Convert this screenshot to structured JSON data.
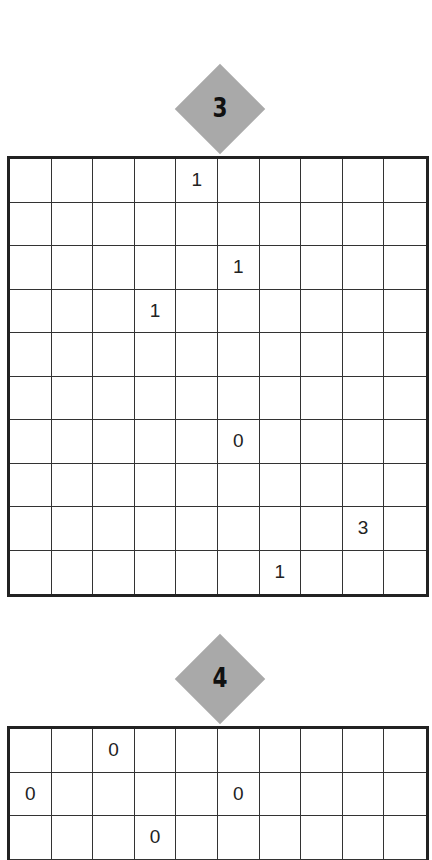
{
  "puzzles": [
    {
      "number": "3",
      "rows": 10,
      "cols": 10,
      "clues": [
        [
          "",
          "",
          "",
          "",
          "1",
          "",
          "",
          "",
          "",
          ""
        ],
        [
          "",
          "",
          "",
          "",
          "",
          "",
          "",
          "",
          "",
          ""
        ],
        [
          "",
          "",
          "",
          "",
          "",
          "1",
          "",
          "",
          "",
          ""
        ],
        [
          "",
          "",
          "",
          "1",
          "",
          "",
          "",
          "",
          "",
          ""
        ],
        [
          "",
          "",
          "",
          "",
          "",
          "",
          "",
          "",
          "",
          ""
        ],
        [
          "",
          "",
          "",
          "",
          "",
          "",
          "",
          "",
          "",
          ""
        ],
        [
          "",
          "",
          "",
          "",
          "",
          "0",
          "",
          "",
          "",
          ""
        ],
        [
          "",
          "",
          "",
          "",
          "",
          "",
          "",
          "",
          "",
          ""
        ],
        [
          "",
          "",
          "",
          "",
          "",
          "",
          "",
          "",
          "3",
          ""
        ],
        [
          "",
          "",
          "",
          "",
          "",
          "",
          "1",
          "",
          "",
          ""
        ]
      ]
    },
    {
      "number": "4",
      "rows": 3,
      "cols": 10,
      "clues": [
        [
          "",
          "",
          "0",
          "",
          "",
          "",
          "",
          "",
          "",
          ""
        ],
        [
          "0",
          "",
          "",
          "",
          "",
          "0",
          "",
          "",
          "",
          ""
        ],
        [
          "",
          "",
          "",
          "0",
          "",
          "",
          "",
          "",
          "",
          ""
        ]
      ]
    }
  ],
  "colors": {
    "badge": "#a9a9a9",
    "grid_line": "#222222"
  }
}
